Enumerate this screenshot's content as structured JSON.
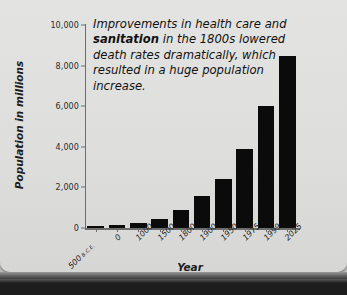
{
  "chart_data": {
    "type": "bar",
    "title": "",
    "xlabel": "Year",
    "ylabel": "Population in millions",
    "categories": [
      "500 B.C.E.",
      "0",
      "1000",
      "1500",
      "1800",
      "1900",
      "1950",
      "1975",
      "1999",
      "2025"
    ],
    "values": [
      100,
      170,
      265,
      425,
      900,
      1600,
      2400,
      3900,
      6000,
      8450
    ],
    "ylim": [
      0,
      10000
    ],
    "yticks": [
      0,
      2000,
      4000,
      6000,
      8000,
      10000
    ],
    "ytick_labels": [
      "0",
      "2,000",
      "4,000",
      "6,000",
      "8,000",
      "10,000"
    ],
    "grid": false,
    "legend": false,
    "bar_color": "#0b0b0b",
    "annotations": [
      {
        "text": "Improvements in health care and sanitation in the 1800s lowered death rates dramatically, which resulted in a huge population increase.",
        "emphasis": "sanitation"
      }
    ]
  },
  "annotation": {
    "line1_a": "Improvements in health",
    "line2_a": "care and ",
    "line2_b": "sanitation",
    "line2_c": " in the",
    "line3": "1800s lowered death rates",
    "line4": "dramatically, which resulted in a",
    "line5": "huge population increase."
  },
  "axes": {
    "y_title": "Population in millions",
    "x_title": "Year"
  },
  "xtick_first": {
    "number": "500",
    "era": "B.C.E."
  },
  "colors": {
    "page": "#dedede",
    "bar": "#0b0b0b",
    "axis": "#6d6d6d",
    "text": "#1d1d1d"
  }
}
